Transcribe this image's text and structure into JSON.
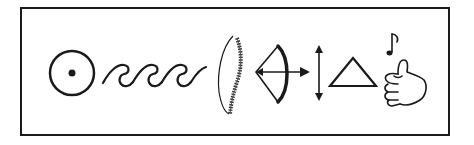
{
  "figure": {
    "title": "Symbol sequence",
    "symbols": [
      {
        "name": "sun-circle-dot",
        "label": "circle with dot"
      },
      {
        "name": "waves",
        "label": "waves"
      },
      {
        "name": "spine",
        "label": "spine"
      },
      {
        "name": "bow-and-arrow",
        "label": "bow and arrow"
      },
      {
        "name": "double-arrow-vertical",
        "label": "vertical double arrow"
      },
      {
        "name": "triangle",
        "label": "triangle"
      },
      {
        "name": "thumbs-up-music",
        "label": "thumbs up with music note"
      }
    ],
    "colors": {
      "stroke": "#1a1a1a",
      "background": "#ffffff"
    }
  }
}
